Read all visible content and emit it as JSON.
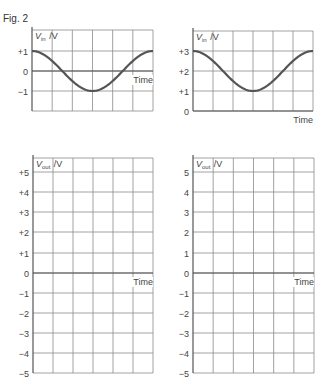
{
  "figure": {
    "label": "Fig. 2"
  },
  "chart_data": [
    {
      "id": "vin-1",
      "type": "line",
      "title": "",
      "ylabel": "V_in / V",
      "ylabel_main": "V",
      "ylabel_sub": "in",
      "ylabel_unit": "/V",
      "xlabel": "Time",
      "yticks": [
        "+1",
        "0",
        "−1"
      ],
      "ytick_values": [
        1,
        0,
        -1
      ],
      "ylim": [
        -2,
        2
      ],
      "x_divisions": 6,
      "grid": true,
      "series": [
        {
          "name": "V_in",
          "shape": "cosine",
          "amplitude": 1,
          "offset": 0,
          "period_divisions": 6,
          "x": [
            0,
            1,
            2,
            3,
            4,
            5,
            6
          ],
          "values": [
            1,
            0.5,
            -0.5,
            -1,
            -0.5,
            0.5,
            1
          ]
        }
      ]
    },
    {
      "id": "vin-2",
      "type": "line",
      "title": "",
      "ylabel": "V_in / V",
      "ylabel_main": "V",
      "ylabel_sub": "in",
      "ylabel_unit": "/V",
      "xlabel": "Time",
      "yticks": [
        "+3",
        "+2",
        "+1",
        "0"
      ],
      "ytick_values": [
        3,
        2,
        1,
        0
      ],
      "ylim": [
        0,
        4
      ],
      "x_divisions": 6,
      "grid": true,
      "series": [
        {
          "name": "V_in",
          "shape": "cosine",
          "amplitude": 1,
          "offset": 2,
          "period_divisions": 6,
          "x": [
            0,
            1,
            2,
            3,
            4,
            5,
            6
          ],
          "values": [
            3,
            2.5,
            1.5,
            1,
            1.5,
            2.5,
            3
          ]
        }
      ]
    },
    {
      "id": "vout-1",
      "type": "line",
      "title": "",
      "ylabel": "V_out / V",
      "ylabel_main": "V",
      "ylabel_sub": "out",
      "ylabel_unit": "/V",
      "xlabel": "Time",
      "yticks": [
        "+5",
        "+4",
        "+3",
        "+2",
        "+1",
        "0",
        "−1",
        "−2",
        "−3",
        "−4",
        "−5"
      ],
      "ytick_values": [
        5,
        4,
        3,
        2,
        1,
        0,
        -1,
        -2,
        -3,
        -4,
        -5
      ],
      "ylim": [
        -5,
        5
      ],
      "x_divisions": 6,
      "grid": true,
      "series": []
    },
    {
      "id": "vout-2",
      "type": "line",
      "title": "",
      "ylabel": "V_out / V",
      "ylabel_main": "V",
      "ylabel_sub": "out",
      "ylabel_unit": "/V",
      "xlabel": "Time",
      "yticks": [
        "5",
        "4",
        "3",
        "2",
        "1",
        "0",
        "−1",
        "−2",
        "−3",
        "−4",
        "−5"
      ],
      "ytick_values": [
        5,
        4,
        3,
        2,
        1,
        0,
        -1,
        -2,
        -3,
        -4,
        -5
      ],
      "ylim": [
        -5,
        5
      ],
      "x_divisions": 6,
      "grid": true,
      "series": []
    }
  ]
}
